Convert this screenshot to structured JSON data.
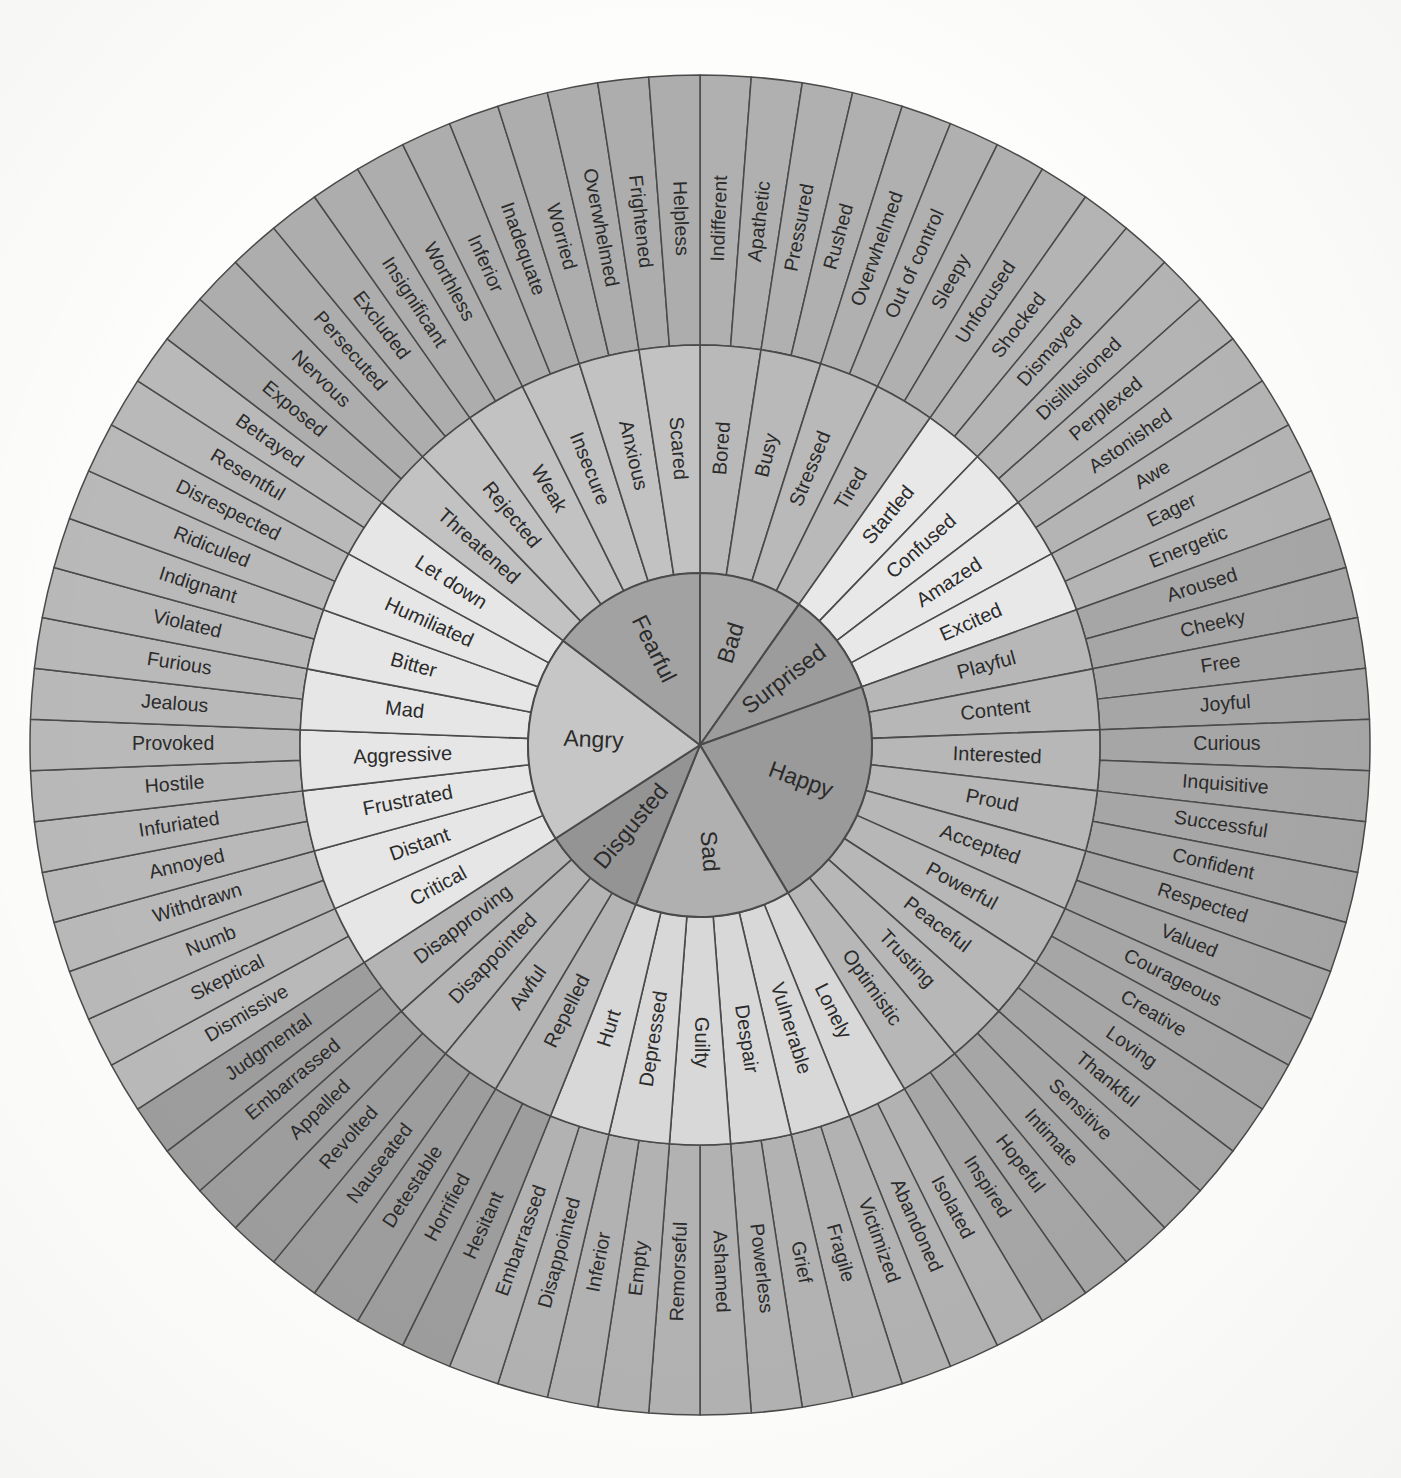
{
  "diagram": {
    "type": "sunburst",
    "rings": 3,
    "center": {
      "cx": 700,
      "cy": 745
    },
    "radii": {
      "core": 172,
      "mid": 400,
      "outer": 670
    },
    "start_angle_deg": -90,
    "palette": {
      "background": "#fdfdfb",
      "stroke": "#4a4a4a",
      "text": "#2b2b2b",
      "tone_dark": "#9e9e9e",
      "tone_mid": "#b5b5b5",
      "tone_light": "#cfcfcf",
      "tone_pale": "#e3e3e3",
      "tone_paler": "#eeeeee"
    },
    "core_emotions": [
      {
        "label": "Bad",
        "core_color": "#a8a8a8",
        "mid_color": "#b9b9b9",
        "outer_color": "#b0b0b0",
        "secondary": [
          {
            "label": "Bored",
            "tertiary": [
              "Indifferent",
              "Apathetic"
            ]
          },
          {
            "label": "Busy",
            "tertiary": [
              "Pressured",
              "Rushed"
            ]
          },
          {
            "label": "Stressed",
            "tertiary": [
              "Overwhelmed",
              "Out of control"
            ]
          },
          {
            "label": "Tired",
            "tertiary": [
              "Sleepy",
              "Unfocused"
            ]
          }
        ]
      },
      {
        "label": "Surprised",
        "core_color": "#9c9c9c",
        "mid_color": "#e8e8e8",
        "outer_color": "#b4b4b4",
        "secondary": [
          {
            "label": "Startled",
            "tertiary": [
              "Shocked",
              "Dismayed"
            ]
          },
          {
            "label": "Confused",
            "tertiary": [
              "Disillusioned",
              "Perplexed"
            ]
          },
          {
            "label": "Amazed",
            "tertiary": [
              "Astonished",
              "Awe"
            ]
          },
          {
            "label": "Excited",
            "tertiary": [
              "Eager",
              "Energetic"
            ]
          }
        ]
      },
      {
        "label": "Happy",
        "core_color": "#9a9a9a",
        "mid_color": "#b7b7b7",
        "outer_color": "#a6a6a6",
        "secondary": [
          {
            "label": "Playful",
            "tertiary": [
              "Aroused",
              "Cheeky"
            ]
          },
          {
            "label": "Content",
            "tertiary": [
              "Free",
              "Joyful"
            ]
          },
          {
            "label": "Interested",
            "tertiary": [
              "Curious",
              "Inquisitive"
            ]
          },
          {
            "label": "Proud",
            "tertiary": [
              "Successful",
              "Confident"
            ]
          },
          {
            "label": "Accepted",
            "tertiary": [
              "Respected",
              "Valued"
            ]
          },
          {
            "label": "Powerful",
            "tertiary": [
              "Courageous",
              "Creative"
            ]
          },
          {
            "label": "Peaceful",
            "tertiary": [
              "Loving",
              "Thankful"
            ]
          },
          {
            "label": "Trusting",
            "tertiary": [
              "Sensitive",
              "Intimate"
            ]
          },
          {
            "label": "Optimistic",
            "tertiary": [
              "Hopeful",
              "Inspired"
            ]
          }
        ]
      },
      {
        "label": "Sad",
        "core_color": "#b0b0b0",
        "mid_color": "#d8d8d8",
        "outer_color": "#b2b2b2",
        "secondary": [
          {
            "label": "Lonely",
            "tertiary": [
              "Isolated",
              "Abandoned"
            ]
          },
          {
            "label": "Vulnerable",
            "tertiary": [
              "Victimized",
              "Fragile"
            ]
          },
          {
            "label": "Despair",
            "tertiary": [
              "Grief",
              "Powerless"
            ]
          },
          {
            "label": "Guilty",
            "tertiary": [
              "Ashamed",
              "Remorseful"
            ]
          },
          {
            "label": "Depressed",
            "tertiary": [
              "Empty",
              "Inferior"
            ]
          },
          {
            "label": "Hurt",
            "tertiary": [
              "Disappointed",
              "Embarrassed"
            ]
          }
        ]
      },
      {
        "label": "Disgusted",
        "core_color": "#949494",
        "mid_color": "#b4b4b4",
        "outer_color": "#9d9d9d",
        "secondary": [
          {
            "label": "Repelled",
            "tertiary": [
              "Hesitant",
              "Horrified"
            ]
          },
          {
            "label": "Awful",
            "tertiary": [
              "Detestable",
              "Nauseated"
            ]
          },
          {
            "label": "Disappointed",
            "tertiary": [
              "Revolted",
              "Appalled"
            ]
          },
          {
            "label": "Disapproving",
            "tertiary": [
              "Embarrassed",
              "Judgmental"
            ]
          }
        ]
      },
      {
        "label": "Angry",
        "core_color": "#c6c6c6",
        "mid_color": "#e6e6e6",
        "outer_color": "#b9b9b9",
        "secondary": [
          {
            "label": "Critical",
            "tertiary": [
              "Dismissive",
              "Skeptical"
            ]
          },
          {
            "label": "Distant",
            "tertiary": [
              "Numb",
              "Withdrawn"
            ]
          },
          {
            "label": "Frustrated",
            "tertiary": [
              "Annoyed",
              "Infuriated"
            ]
          },
          {
            "label": "Aggressive",
            "tertiary": [
              "Hostile",
              "Provoked"
            ]
          },
          {
            "label": "Mad",
            "tertiary": [
              "Jealous",
              "Furious"
            ]
          },
          {
            "label": "Bitter",
            "tertiary": [
              "Violated",
              "Indignant"
            ]
          },
          {
            "label": "Humiliated",
            "tertiary": [
              "Ridiculed",
              "Disrespected"
            ]
          },
          {
            "label": "Let down",
            "tertiary": [
              "Resentful",
              "Betrayed"
            ]
          }
        ]
      },
      {
        "label": "Fearful",
        "core_color": "#a2a2a2",
        "mid_color": "#c2c2c2",
        "outer_color": "#adadad",
        "secondary": [
          {
            "label": "Threatened",
            "tertiary": [
              "Exposed",
              "Nervous"
            ]
          },
          {
            "label": "Rejected",
            "tertiary": [
              "Persecuted",
              "Excluded"
            ]
          },
          {
            "label": "Weak",
            "tertiary": [
              "Insignificant",
              "Worthless"
            ]
          },
          {
            "label": "Insecure",
            "tertiary": [
              "Inferior",
              "Inadequate"
            ]
          },
          {
            "label": "Anxious",
            "tertiary": [
              "Worried",
              "Overwhelmed"
            ]
          },
          {
            "label": "Scared",
            "tertiary": [
              "Frightened",
              "Helpless"
            ]
          }
        ]
      }
    ]
  }
}
